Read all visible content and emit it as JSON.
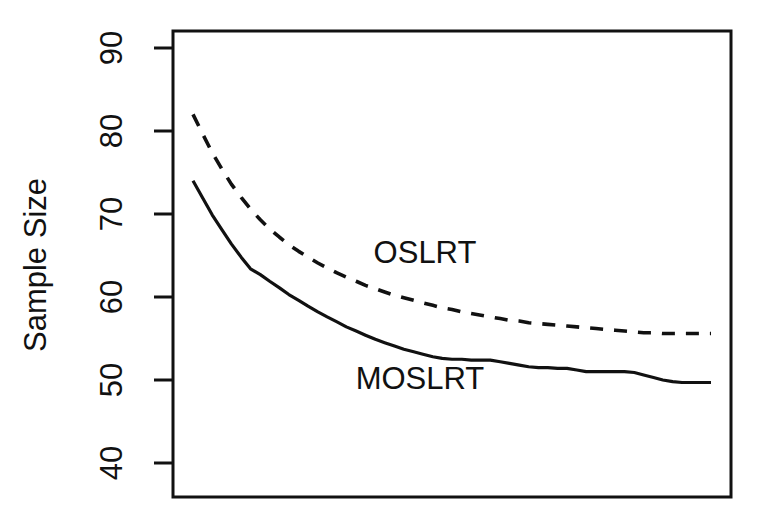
{
  "figure": {
    "background_color": "#ffffff",
    "ink_color": "#111111"
  },
  "axis": {
    "y_label": "Sample Size",
    "y_ticks": [
      "40",
      "50",
      "60",
      "70",
      "80",
      "90"
    ],
    "x_label": ""
  },
  "labels": {
    "oslrt": "OSLRT",
    "moslrt": "MOSLRT"
  },
  "chart_data": {
    "type": "line",
    "title": "",
    "xlabel": "",
    "ylabel": "Sample Size",
    "ylim": [
      36,
      92
    ],
    "xlim": [
      0,
      1
    ],
    "grid": false,
    "legend": "inline-annotations",
    "y_ticks": [
      40,
      50,
      60,
      70,
      80,
      90
    ],
    "x_ticks": [],
    "series": [
      {
        "name": "OSLRT",
        "style": "dashed",
        "annotation": "OSLRT",
        "x": [
          0.0,
          0.019,
          0.037,
          0.056,
          0.074,
          0.093,
          0.111,
          0.13,
          0.148,
          0.167,
          0.185,
          0.204,
          0.222,
          0.241,
          0.259,
          0.278,
          0.296,
          0.315,
          0.333,
          0.352,
          0.37,
          0.389,
          0.407,
          0.426,
          0.444,
          0.463,
          0.481,
          0.5,
          0.519,
          0.537,
          0.556,
          0.574,
          0.593,
          0.611,
          0.63,
          0.648,
          0.667,
          0.685,
          0.704,
          0.722,
          0.741,
          0.759,
          0.778,
          0.796,
          0.815,
          0.833,
          0.852,
          0.87,
          0.889,
          0.907,
          0.926,
          0.944,
          0.963,
          0.981,
          1.0
        ],
        "y": [
          82.0,
          79.6,
          77.4,
          75.4,
          73.6,
          72.0,
          70.6,
          69.3,
          68.2,
          67.2,
          66.3,
          65.5,
          64.8,
          64.1,
          63.5,
          62.9,
          62.4,
          61.9,
          61.4,
          61.0,
          60.6,
          60.2,
          59.9,
          59.6,
          59.3,
          59.0,
          58.7,
          58.5,
          58.2,
          58.0,
          57.8,
          57.6,
          57.4,
          57.2,
          57.1,
          56.9,
          56.8,
          56.7,
          56.6,
          56.5,
          56.4,
          56.3,
          56.2,
          56.1,
          56.0,
          55.9,
          55.8,
          55.7,
          55.7,
          55.6,
          55.6,
          55.6,
          55.6,
          55.6,
          55.6
        ]
      },
      {
        "name": "MOSLRT",
        "style": "solid",
        "annotation": "MOSLRT",
        "x": [
          0.0,
          0.019,
          0.037,
          0.056,
          0.074,
          0.093,
          0.111,
          0.13,
          0.148,
          0.167,
          0.185,
          0.204,
          0.222,
          0.241,
          0.259,
          0.278,
          0.296,
          0.315,
          0.333,
          0.352,
          0.37,
          0.389,
          0.407,
          0.426,
          0.444,
          0.463,
          0.481,
          0.5,
          0.519,
          0.537,
          0.556,
          0.574,
          0.593,
          0.611,
          0.63,
          0.648,
          0.667,
          0.685,
          0.704,
          0.722,
          0.741,
          0.759,
          0.778,
          0.796,
          0.815,
          0.833,
          0.852,
          0.87,
          0.889,
          0.907,
          0.926,
          0.944,
          0.963,
          0.981,
          1.0
        ],
        "y": [
          74.0,
          71.9,
          69.9,
          68.1,
          66.4,
          64.8,
          63.4,
          62.7,
          61.9,
          61.1,
          60.3,
          59.6,
          58.9,
          58.2,
          57.6,
          57.0,
          56.4,
          55.9,
          55.4,
          54.9,
          54.5,
          54.1,
          53.7,
          53.4,
          53.1,
          52.8,
          52.6,
          52.5,
          52.5,
          52.4,
          52.4,
          52.4,
          52.2,
          52.0,
          51.8,
          51.6,
          51.5,
          51.5,
          51.4,
          51.4,
          51.2,
          51.0,
          51.0,
          51.0,
          51.0,
          51.0,
          50.9,
          50.6,
          50.3,
          50.0,
          49.8,
          49.7,
          49.7,
          49.7,
          49.7
        ]
      }
    ],
    "annotations": [
      {
        "text": "OSLRT",
        "x_px": 425,
        "y_px": 252
      },
      {
        "text": "MOSLRT",
        "x_px": 420,
        "y_px": 378
      }
    ]
  },
  "geometry": {
    "plot_left_px": 173,
    "plot_right_px": 731,
    "plot_top_px": 31,
    "plot_bottom_px": 497,
    "data_left_px": 193,
    "data_right_px": 711,
    "y_value_at_top_tick": 90,
    "y_top_tick_px": 48,
    "px_per_unit": 8.3
  }
}
